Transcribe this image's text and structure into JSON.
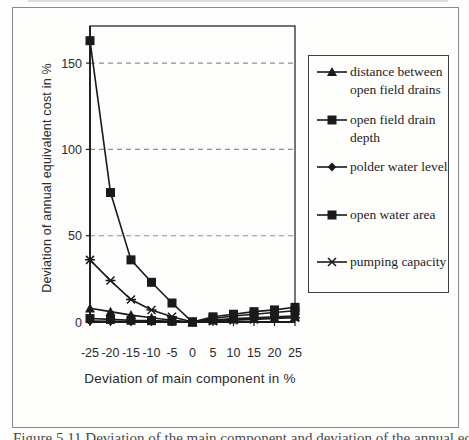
{
  "figure": {
    "caption_fragment": "Figure 5.11 Deviation of the main component and deviation of the annual equivalent cost"
  },
  "chart_data": {
    "type": "line",
    "title": "",
    "xlabel": "Deviation of main component in %",
    "ylabel": "Deviation of annual equivalent cost in %",
    "x_categories": [
      -25,
      -20,
      -15,
      -10,
      -5,
      0,
      5,
      10,
      15,
      20,
      25
    ],
    "y_ticks": [
      0,
      50,
      100,
      150
    ],
    "ylim": [
      0,
      171.5
    ],
    "grid": "horizontal dashed gridlines at y ticks",
    "legend_position": "right, boxed",
    "series": [
      {
        "name": "distance between open field drains",
        "marker": "triangle",
        "values": [
          8,
          6,
          4,
          2.5,
          1,
          0,
          1,
          1.5,
          2,
          2.5,
          3
        ]
      },
      {
        "name": "open field drain depth",
        "marker": "square",
        "values": [
          163,
          75,
          36,
          23,
          11,
          0,
          3,
          4.5,
          6,
          7,
          8.5
        ]
      },
      {
        "name": "polder water level",
        "marker": "diamond",
        "values": [
          0.5,
          0.4,
          0.3,
          0.2,
          0.1,
          0,
          1,
          2,
          2.5,
          3,
          3.5
        ]
      },
      {
        "name": "open water area",
        "marker": "square",
        "values": [
          2,
          1.5,
          1,
          0.8,
          0.4,
          0,
          2,
          3.5,
          4.5,
          5.5,
          6.5
        ]
      },
      {
        "name": "pumping capacity",
        "marker": "xstar",
        "values": [
          36,
          24,
          13,
          7,
          3,
          0,
          0.5,
          1,
          1.5,
          2,
          2.5
        ]
      }
    ],
    "colors": {
      "line": "#1a1a1a",
      "grid": "#8f8f8f",
      "text": "#2b2b2b"
    }
  }
}
